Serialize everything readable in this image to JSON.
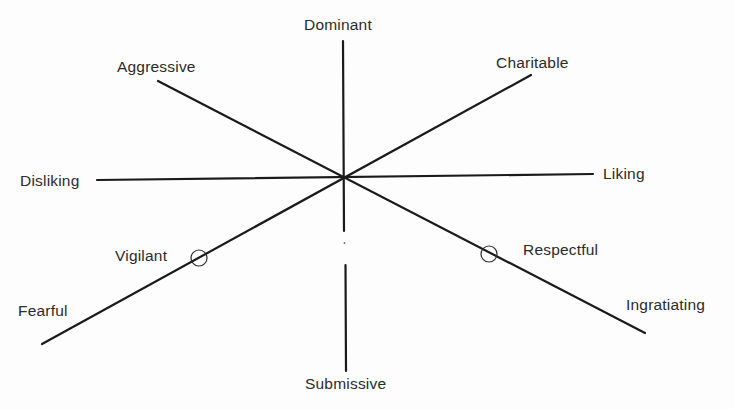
{
  "diagram": {
    "type": "interpersonal-circumplex",
    "center": {
      "x": 343,
      "y": 178
    },
    "axes": [
      {
        "name": "dominant-submissive",
        "from": {
          "x": 343,
          "y": 41
        },
        "to": {
          "x": 346,
          "y": 371
        },
        "gap": {
          "from_y": 231,
          "to_y": 265
        }
      },
      {
        "name": "disliking-liking",
        "from": {
          "x": 97,
          "y": 180
        },
        "to": {
          "x": 593,
          "y": 174
        }
      },
      {
        "name": "aggressive-ingratiating",
        "from": {
          "x": 158,
          "y": 81
        },
        "to": {
          "x": 645,
          "y": 333
        }
      },
      {
        "name": "fearful-charitable",
        "from": {
          "x": 42,
          "y": 344
        },
        "to": {
          "x": 531,
          "y": 75
        }
      }
    ],
    "markers": [
      {
        "name": "vigilant",
        "x": 199,
        "y": 258,
        "r": 8
      },
      {
        "name": "respectful",
        "x": 489,
        "y": 254,
        "r": 8
      }
    ],
    "labels": {
      "dominant": "Dominant",
      "submissive": "Submissive",
      "aggressive": "Aggressive",
      "charitable": "Charitable",
      "disliking": "Disliking",
      "liking": "Liking",
      "fearful": "Fearful",
      "ingratiating": "Ingratiating",
      "vigilant": "Vigilant",
      "respectful": "Respectful"
    },
    "colors": {
      "line": "#1a1a1a",
      "text": "#2b2b2b",
      "background": "#fdfdfd"
    }
  }
}
